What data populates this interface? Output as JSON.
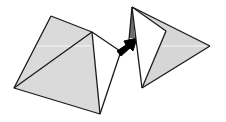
{
  "diagram": {
    "colors": {
      "face_fill": "#dadada",
      "face_white": "#ffffff",
      "sliver_dark": "#6e6e6e",
      "stroke": "#1a1a1a",
      "arrow": "#000000",
      "highlight_line": "#ffffff"
    },
    "left_pyramid": {
      "vertices": {
        "top": [
          51,
          16
        ],
        "apex": [
          92,
          32
        ],
        "left": [
          14,
          88
        ],
        "bottom": [
          100,
          114
        ]
      }
    },
    "arrow": {
      "direction": "up-right",
      "from": [
        120,
        54
      ],
      "to": [
        136,
        40
      ]
    },
    "right_pyramid": {
      "vertices": {
        "top": [
          132,
          7
        ],
        "inner": [
          166,
          31
        ],
        "bottom": [
          142,
          88
        ],
        "tip": [
          210,
          46
        ],
        "sliver_base": [
          130,
          38
        ]
      }
    }
  }
}
